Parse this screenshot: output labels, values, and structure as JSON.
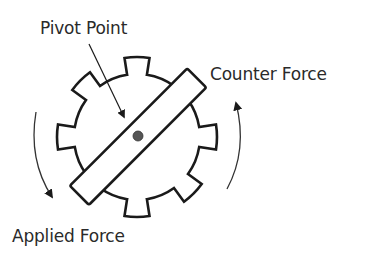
{
  "diagram": {
    "labels": {
      "pivot_point": "Pivot Point",
      "counter_force": "Counter Force",
      "applied_force": "Applied Force"
    },
    "colors": {
      "stroke": "#1a1a1a",
      "arrow": "#333333",
      "pivot_dot": "#555555",
      "background": "#ffffff"
    }
  }
}
